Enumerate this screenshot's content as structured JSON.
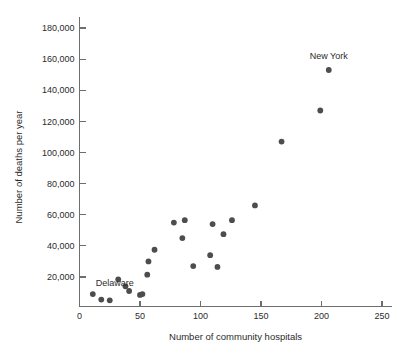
{
  "chart_data": {
    "type": "scatter",
    "title": "",
    "xlabel": "Number of community hospitals",
    "ylabel": "Number of deaths per year",
    "xlim": [
      0,
      260
    ],
    "ylim": [
      0,
      190000
    ],
    "grid": false,
    "legend": "none",
    "x_ticks": [
      {
        "value": 0,
        "label": "0"
      },
      {
        "value": 50,
        "label": "50"
      },
      {
        "value": 100,
        "label": "100"
      },
      {
        "value": 150,
        "label": "150"
      },
      {
        "value": 200,
        "label": "200"
      },
      {
        "value": 250,
        "label": "250"
      }
    ],
    "y_ticks": [
      {
        "value": 20000,
        "label": "20,000"
      },
      {
        "value": 40000,
        "label": "40,000"
      },
      {
        "value": 60000,
        "label": "60,000"
      },
      {
        "value": 80000,
        "label": "80,000"
      },
      {
        "value": 100000,
        "label": "100,000"
      },
      {
        "value": 120000,
        "label": "120,000"
      },
      {
        "value": 140000,
        "label": "140,000"
      },
      {
        "value": 160000,
        "label": "160,000"
      },
      {
        "value": 180000,
        "label": "180,000"
      }
    ],
    "point_color": "#4d4d4d",
    "axis_color": "#6e6e6e",
    "points": [
      {
        "x": 11,
        "y": 9000
      },
      {
        "x": 18,
        "y": 5500
      },
      {
        "x": 25,
        "y": 5000
      },
      {
        "x": 32,
        "y": 18500
      },
      {
        "x": 38,
        "y": 14000
      },
      {
        "x": 41,
        "y": 11000
      },
      {
        "x": 50,
        "y": 8500
      },
      {
        "x": 52,
        "y": 9000
      },
      {
        "x": 56,
        "y": 21500
      },
      {
        "x": 57,
        "y": 30000
      },
      {
        "x": 62,
        "y": 37500
      },
      {
        "x": 78,
        "y": 55000
      },
      {
        "x": 85,
        "y": 45000
      },
      {
        "x": 87,
        "y": 56500
      },
      {
        "x": 94,
        "y": 27000
      },
      {
        "x": 108,
        "y": 34000
      },
      {
        "x": 110,
        "y": 54000
      },
      {
        "x": 114,
        "y": 26500
      },
      {
        "x": 119,
        "y": 47500
      },
      {
        "x": 126,
        "y": 56500
      },
      {
        "x": 145,
        "y": 66000
      },
      {
        "x": 167,
        "y": 107000
      },
      {
        "x": 199,
        "y": 127000
      },
      {
        "x": 206,
        "y": 153000
      }
    ],
    "annotations": [
      {
        "name": "Delaware",
        "text": "Delaware",
        "x": 11,
        "y": 9000,
        "dx": 3,
        "dy": -8,
        "anchor": "start"
      },
      {
        "name": "New York",
        "text": "New York",
        "x": 206,
        "y": 153000,
        "dx": 0,
        "dy": -11,
        "anchor": "middle"
      }
    ]
  }
}
